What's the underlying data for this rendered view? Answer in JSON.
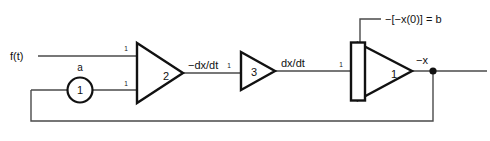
{
  "diagram": {
    "type": "analog-computer-block-diagram",
    "colors": {
      "wire": "#4a4a4a",
      "outline": "#111111",
      "text": "#111111",
      "background": "#ffffff"
    },
    "input": {
      "label": "f(t)"
    },
    "potentiometer": {
      "coefficient_label": "a",
      "value_label": "1"
    },
    "amplifiers": [
      {
        "id": "summer",
        "number_label": "2",
        "input_gain_top": "1",
        "input_gain_bottom": "1",
        "output_label": "−dx/dt"
      },
      {
        "id": "inverter",
        "number_label": "3",
        "input_gain": "1",
        "output_label": "dx/dt"
      },
      {
        "id": "integrator",
        "number_label": "1",
        "input_gain": "1",
        "initial_condition_label": "−[−x(0)]  =  b",
        "output_label": "−x"
      }
    ],
    "node": {
      "name": "output-junction"
    }
  }
}
